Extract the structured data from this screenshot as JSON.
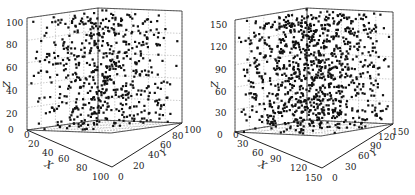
{
  "chart_data": [
    {
      "type": "scatter3d",
      "title": "",
      "xlabel": "X",
      "ylabel": "Y",
      "zlabel": "Z",
      "xlim": [
        0,
        100
      ],
      "ylim": [
        0,
        100
      ],
      "zlim": [
        0,
        100
      ],
      "xticks": [
        "0",
        "20",
        "40",
        "60",
        "80",
        "100"
      ],
      "yticks": [
        "0",
        "20",
        "40",
        "60",
        "80",
        "100"
      ],
      "zticks": [
        "0",
        "20",
        "40",
        "60",
        "80",
        "100"
      ],
      "grid": true,
      "marker": "square",
      "marker_color": "#111111",
      "n_points_approx": 600,
      "distribution": "uniform random in cube [0,100]^3"
    },
    {
      "type": "scatter3d",
      "title": "",
      "xlabel": "X",
      "ylabel": "Y",
      "zlabel": "Z",
      "xlim": [
        0,
        150
      ],
      "ylim": [
        0,
        150
      ],
      "zlim": [
        0,
        150
      ],
      "xticks": [
        "0",
        "30",
        "60",
        "90",
        "120",
        "150"
      ],
      "yticks": [
        "0",
        "30",
        "60",
        "90",
        "120",
        "150"
      ],
      "zticks": [
        "0",
        "30",
        "60",
        "90",
        "120",
        "150"
      ],
      "grid": true,
      "marker": "square",
      "marker_color": "#111111",
      "n_points_approx": 1000,
      "distribution": "uniform random in cube [0,150]^3"
    }
  ],
  "plots": [
    {
      "id": "left",
      "zlabel": "Z",
      "xlabel": "X",
      "ylabel": "Y",
      "zticks": [
        "20",
        "40",
        "60",
        "80",
        "100"
      ],
      "xticks": [
        "0",
        "20",
        "40",
        "60",
        "80",
        "100"
      ],
      "yticks": [
        "0",
        "20",
        "40",
        "60",
        "80",
        "100"
      ],
      "z0": "0"
    },
    {
      "id": "right",
      "zlabel": "Z",
      "xlabel": "X",
      "ylabel": "Y",
      "zticks": [
        "30",
        "60",
        "90",
        "120",
        "150"
      ],
      "xticks": [
        "0",
        "30",
        "60",
        "90",
        "120",
        "150"
      ],
      "yticks": [
        "0",
        "30",
        "60",
        "90",
        "120",
        "150"
      ],
      "z0": "0"
    }
  ]
}
